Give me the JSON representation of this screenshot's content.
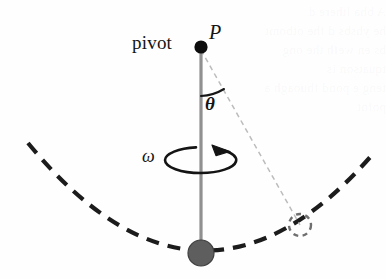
{
  "figure": {
    "kind": "conical-pendulum-diagram",
    "background_color": "#fefefe",
    "width": 386,
    "height": 279,
    "labels": {
      "pivot": "pivot",
      "point_p": "P",
      "angle_theta": "θ",
      "angular_velocity_omega": "ω"
    },
    "colors": {
      "ink": "#141414",
      "rod": "#8f8f8f",
      "bob_fill": "#5e5e5e",
      "bob_stroke": "#3a3a3a",
      "dashed_arc": "#1c1c1c",
      "thin_dashed_line": "#b9b9b9",
      "ghost_text": "rgba(140,140,150,0.055)"
    },
    "elements": {
      "pivot_dot": {
        "cx": 201,
        "cy": 47,
        "r": 6.5
      },
      "rod": {
        "x": 201,
        "y1": 47,
        "y2": 253,
        "width": 3
      },
      "bob": {
        "cx": 201,
        "cy": 253,
        "r": 13
      },
      "ghost_bob": {
        "cx": 300,
        "cy": 225,
        "r": 11
      },
      "theta_arc": {
        "from_deg": 0,
        "to_deg": 29
      },
      "omega_ellipse": {
        "cx": 201,
        "cy": 160,
        "rx": 36,
        "ry": 13
      },
      "swing_arc": {
        "left": [
          28,
          143
        ],
        "bottom": [
          201,
          266
        ],
        "right": [
          372,
          155
        ]
      }
    }
  },
  "ghost_text": "A bha lthere d\nhe yhsbs d fhe otbomt\nbs en wefh the ong tquatson is\nteng e pond fhuoagh a pofnt"
}
